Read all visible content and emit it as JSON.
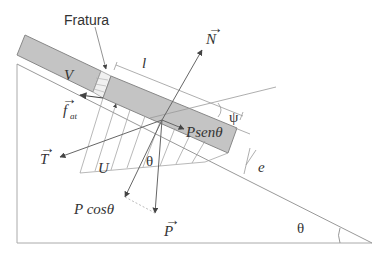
{
  "diagram": {
    "type": "free-body diagram on inclined plane",
    "labels": {
      "fracture": "Fratura",
      "upper_block": "V",
      "length": "l",
      "normal": "N",
      "angle_psi": "ψ",
      "friction": "f",
      "friction_sub": "at",
      "tangential_component": "Psenθ",
      "tension": "T",
      "uplift": "U",
      "theta_center": "θ",
      "thickness": "e",
      "normal_component": "P cosθ",
      "weight": "P",
      "theta_slope": "θ"
    },
    "colors": {
      "block_fill": "#c4c4c4",
      "block_stroke": "#888888",
      "line": "#9a9a9a",
      "arrow": "#555555",
      "text": "#333333"
    }
  }
}
